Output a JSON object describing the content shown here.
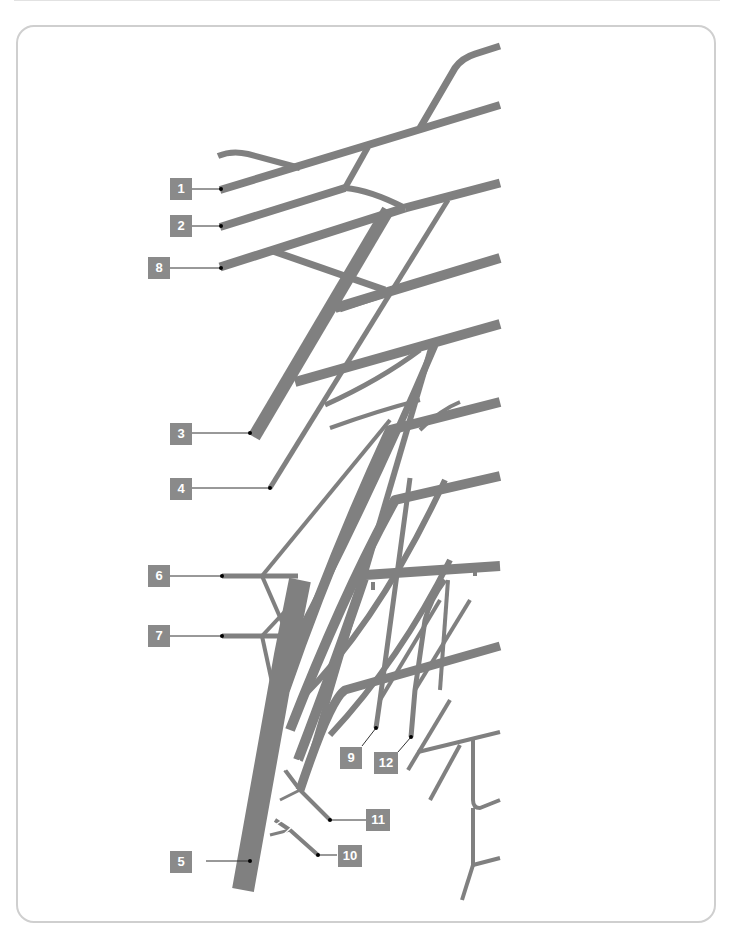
{
  "colors": {
    "structure": "#808080",
    "label_bg": "#8a8a8a",
    "label_text": "#ffffff",
    "leader": "#333333",
    "frame": "#cfcfcf"
  },
  "labels": [
    {
      "id": "1",
      "text": "1"
    },
    {
      "id": "2",
      "text": "2"
    },
    {
      "id": "8",
      "text": "8"
    },
    {
      "id": "3",
      "text": "3"
    },
    {
      "id": "4",
      "text": "4"
    },
    {
      "id": "6",
      "text": "6"
    },
    {
      "id": "7",
      "text": "7"
    },
    {
      "id": "9",
      "text": "9"
    },
    {
      "id": "12",
      "text": "12"
    },
    {
      "id": "11",
      "text": "11"
    },
    {
      "id": "5",
      "text": "5"
    },
    {
      "id": "10",
      "text": "10"
    }
  ],
  "page_number": ""
}
